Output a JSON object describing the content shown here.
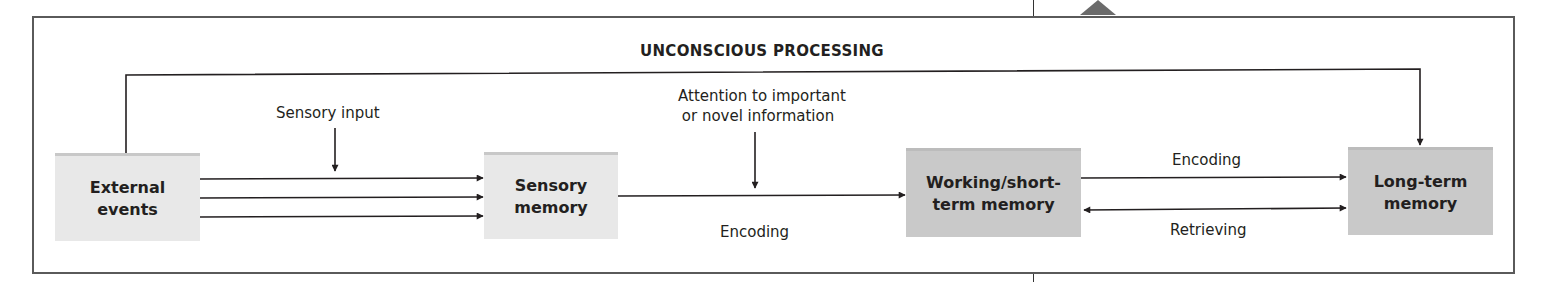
{
  "diagram": {
    "title": "UNCONSCIOUS PROCESSING",
    "nodes": [
      {
        "id": "external",
        "label_line1": "External",
        "label_line2": "events"
      },
      {
        "id": "sensory",
        "label_line1": "Sensory",
        "label_line2": "memory"
      },
      {
        "id": "working",
        "label_line1": "Working/short-",
        "label_line2": "term memory"
      },
      {
        "id": "longterm",
        "label_line1": "Long-term",
        "label_line2": "memory"
      }
    ],
    "annotations": {
      "sensory_input": "Sensory input",
      "attention_line1": "Attention to important",
      "attention_line2": "or novel information",
      "encoding_1": "Encoding",
      "encoding_2": "Encoding",
      "retrieving": "Retrieving"
    },
    "edges": [
      {
        "from": "external",
        "to": "sensory",
        "count": 3
      },
      {
        "from": "sensory",
        "to": "working",
        "label": "Encoding"
      },
      {
        "from": "working",
        "to": "longterm",
        "label": "Encoding"
      },
      {
        "from": "longterm",
        "to": "working",
        "label": "Retrieving"
      },
      {
        "from": "external",
        "to": "longterm",
        "label": "UNCONSCIOUS PROCESSING"
      }
    ],
    "colors": {
      "light_box": "#e8e8e8",
      "dark_box": "#c9c9c9",
      "frame": "#5a5a5a",
      "line": "#231f20"
    }
  }
}
